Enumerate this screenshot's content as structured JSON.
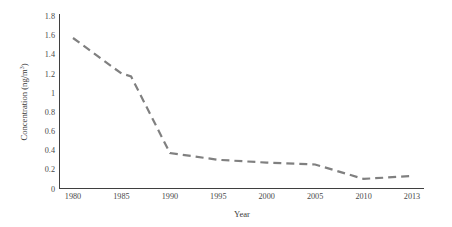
{
  "chart_data": {
    "type": "line",
    "title": "",
    "xlabel": "Year",
    "ylabel": "Concentration (ng/m³)",
    "ylabel_base": "Concentration (ng/m",
    "ylabel_sup": "3",
    "ylabel_close": ")",
    "x": [
      1980,
      1985,
      1986,
      1990,
      1995,
      2000,
      2005,
      2010,
      2013
    ],
    "values": [
      1.57,
      1.2,
      1.17,
      0.37,
      0.3,
      0.27,
      0.25,
      0.1,
      0.13
    ],
    "series": [
      {
        "name": "Concentration",
        "values": [
          1.57,
          1.2,
          1.17,
          0.37,
          0.3,
          0.27,
          0.25,
          0.1,
          0.13
        ]
      }
    ],
    "xticks": [
      "1980",
      "1985",
      "1990",
      "1995",
      "2000",
      "2005",
      "2010",
      "2013"
    ],
    "xtick_values": [
      1980,
      1985,
      1990,
      1995,
      2000,
      2005,
      2010,
      2013
    ],
    "yticks": [
      "0",
      "0.2",
      "0.4",
      "0.6",
      "0.8",
      "1",
      "1.2",
      "1.4",
      "1.6",
      "1.8"
    ],
    "ytick_values": [
      0,
      0.2,
      0.4,
      0.6,
      0.8,
      1,
      1.2,
      1.4,
      1.6,
      1.8
    ],
    "ylim": [
      0,
      1.8
    ],
    "xlim": [
      1980,
      2013
    ],
    "grid": false,
    "legend": false,
    "line_style": "dashed",
    "line_color": "#808080",
    "axis_color": "#3f3f3f",
    "background": "#ffffff"
  }
}
